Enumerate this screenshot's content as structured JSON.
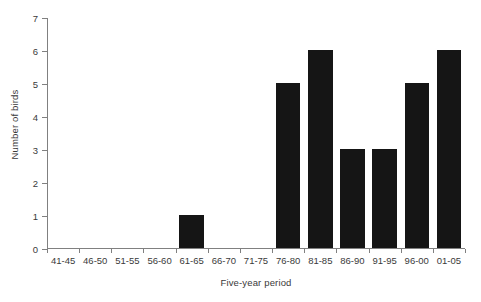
{
  "chart_data": {
    "type": "bar",
    "title": "",
    "xlabel": "Five-year period",
    "ylabel": "Number of birds",
    "categories": [
      "41-45",
      "46-50",
      "51-55",
      "56-60",
      "61-65",
      "66-70",
      "71-75",
      "76-80",
      "81-85",
      "86-90",
      "91-95",
      "96-00",
      "01-05"
    ],
    "values": [
      0,
      0,
      0,
      0,
      1,
      0,
      0,
      5,
      6,
      3,
      3,
      5,
      6
    ],
    "ylim": [
      0,
      7
    ],
    "ytick_labels": [
      "0",
      "1",
      "2",
      "3",
      "4",
      "5",
      "6",
      "7"
    ],
    "ytick_values": [
      0,
      1,
      2,
      3,
      4,
      5,
      6,
      7
    ],
    "grid": false,
    "legend": null,
    "bar_color": "#151515",
    "axis_color": "#808080",
    "text_color": "#3a3a3a",
    "background": "#ffffff"
  }
}
